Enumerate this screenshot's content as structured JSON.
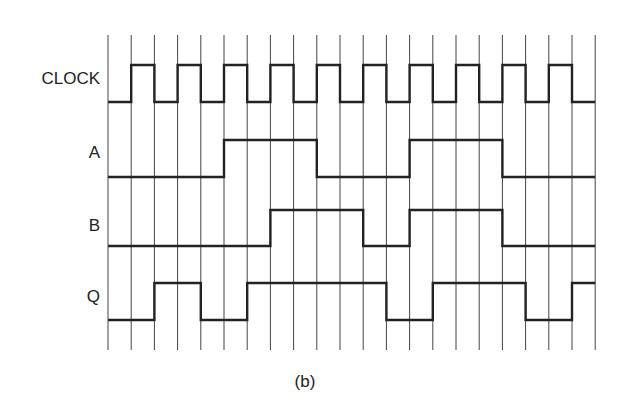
{
  "diagram": {
    "type": "timing-diagram",
    "caption": "(b)",
    "grid": {
      "x_start": 108,
      "spacing": 23.2,
      "count": 22,
      "y_top": 35,
      "y_bottom": 350
    },
    "signals": [
      {
        "name": "CLOCK",
        "label_y": 69,
        "y_high": 65,
        "y_low": 102,
        "levels": [
          0,
          1,
          0,
          1,
          0,
          1,
          0,
          1,
          0,
          1,
          0,
          1,
          0,
          1,
          0,
          1,
          0,
          1,
          0,
          1,
          0
        ]
      },
      {
        "name": "A",
        "label_y": 143,
        "y_high": 140,
        "y_low": 177,
        "levels": [
          0,
          0,
          0,
          0,
          0,
          1,
          1,
          1,
          1,
          0,
          0,
          0,
          0,
          1,
          1,
          1,
          1,
          0,
          0,
          0,
          0
        ]
      },
      {
        "name": "B",
        "label_y": 216,
        "y_high": 210,
        "y_low": 246,
        "levels": [
          0,
          0,
          0,
          0,
          0,
          0,
          0,
          1,
          1,
          1,
          1,
          0,
          0,
          1,
          1,
          1,
          1,
          0,
          0,
          0,
          0
        ]
      },
      {
        "name": "Q",
        "label_y": 287,
        "y_high": 283,
        "y_low": 320,
        "levels": [
          0,
          0,
          1,
          1,
          0,
          0,
          1,
          1,
          1,
          1,
          1,
          1,
          0,
          0,
          1,
          1,
          1,
          1,
          0,
          0,
          1
        ]
      }
    ],
    "colors": {
      "grid": "#444444",
      "trace": "#222222",
      "text": "#222222"
    }
  }
}
